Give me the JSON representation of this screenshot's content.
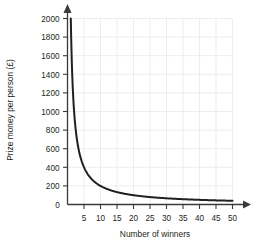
{
  "chart_data": {
    "type": "line",
    "title": "",
    "xlabel": "Number of winners",
    "ylabel": "Prize money per person (£)",
    "xlim": [
      0,
      50
    ],
    "ylim": [
      0,
      2000
    ],
    "grid": true,
    "legend": "none",
    "currency_symbol": "£",
    "relationship": "y = 2000 / x",
    "constant_k": 2000,
    "xticks": [
      0,
      5,
      10,
      15,
      20,
      25,
      30,
      35,
      40,
      45,
      50
    ],
    "xtick_labels": [
      "0",
      "5",
      "10",
      "15",
      "20",
      "25",
      "30",
      "35",
      "40",
      "45",
      "50"
    ],
    "yticks": [
      0,
      200,
      400,
      600,
      800,
      1000,
      1200,
      1400,
      1600,
      1800,
      2000
    ],
    "ytick_labels": [
      "0",
      "200",
      "400",
      "600",
      "800",
      "1000",
      "1200",
      "1400",
      "1600",
      "1800",
      "2000"
    ],
    "series": [
      {
        "name": "Prize money per person",
        "color": "#231f20",
        "x": [
          1,
          1.25,
          1.5,
          1.75,
          2,
          2.5,
          3,
          3.5,
          4,
          4.5,
          5,
          6,
          7,
          8,
          9,
          10,
          12,
          14,
          16,
          18,
          20,
          25,
          30,
          35,
          40,
          45,
          50
        ],
        "values": [
          2000,
          1600,
          1333,
          1143,
          1000,
          800,
          667,
          571,
          500,
          444,
          400,
          333,
          286,
          250,
          222,
          200,
          167,
          143,
          125,
          111,
          100,
          80,
          67,
          57,
          50,
          44,
          40
        ]
      }
    ],
    "annotations": []
  },
  "axes": {
    "x_axis_label": "Number of winners",
    "y_axis_label": "Prize money per person (£)",
    "origin_label": "0"
  },
  "icons": {
    "x_axis_arrow": "arrow-right-icon",
    "y_axis_arrow": "arrow-up-icon"
  },
  "colors": {
    "curve": "#231f20",
    "grid": "#e8e8ea",
    "axis": "#3a3a3c",
    "text": "#231f20",
    "background": "#ffffff"
  }
}
